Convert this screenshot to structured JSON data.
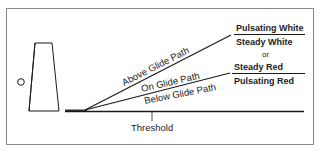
{
  "diagram": {
    "type": "VASI glide path indication",
    "paths": [
      {
        "label": "Above Glide Path"
      },
      {
        "label": "On Glide Path"
      },
      {
        "label": "Below Glide Path"
      }
    ],
    "indications": {
      "above": "Pulsating White",
      "on_upper": "Steady White",
      "separator": "or",
      "on_lower": "Steady Red",
      "below": "Pulsating Red"
    },
    "threshold_label": "Threshold",
    "colors": {
      "line": "#1a1a1a",
      "border": "#8a8a8a",
      "text": "#222222"
    }
  }
}
